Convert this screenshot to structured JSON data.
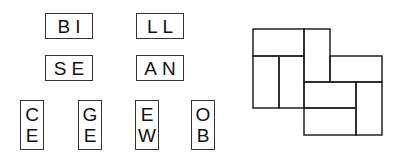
{
  "horizontal_tiles": [
    {
      "text": "BI",
      "x": 45,
      "y": 13
    },
    {
      "text": "LL",
      "x": 136,
      "y": 13
    },
    {
      "text": "SE",
      "x": 45,
      "y": 55
    },
    {
      "text": "AN",
      "x": 136,
      "y": 55
    }
  ],
  "vertical_tiles": [
    {
      "top": "C",
      "bottom": "E",
      "x": 20,
      "y": 100
    },
    {
      "top": "G",
      "bottom": "E",
      "x": 78,
      "y": 100
    },
    {
      "top": "E",
      "bottom": "W",
      "x": 135,
      "y": 100
    },
    {
      "top": "O",
      "bottom": "B",
      "x": 191,
      "y": 100
    }
  ],
  "grid": {
    "stroke": "#222222",
    "rects": [
      {
        "x": 253,
        "y": 29,
        "w": 51,
        "h": 27
      },
      {
        "x": 304,
        "y": 29,
        "w": 26,
        "h": 53
      },
      {
        "x": 253,
        "y": 56,
        "w": 26,
        "h": 52
      },
      {
        "x": 279,
        "y": 56,
        "w": 25,
        "h": 52
      },
      {
        "x": 330,
        "y": 56,
        "w": 52,
        "h": 26
      },
      {
        "x": 304,
        "y": 82,
        "w": 52,
        "h": 26
      },
      {
        "x": 356,
        "y": 82,
        "w": 26,
        "h": 53
      },
      {
        "x": 304,
        "y": 108,
        "w": 52,
        "h": 27
      }
    ]
  }
}
